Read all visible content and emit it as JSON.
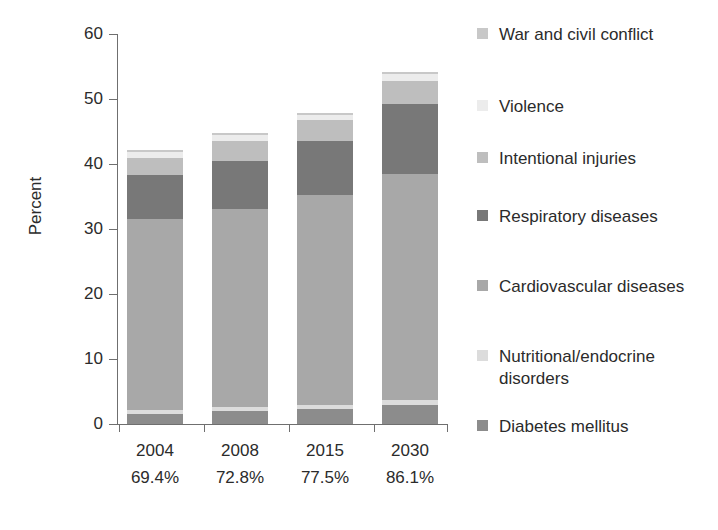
{
  "chart_data": {
    "type": "bar",
    "stacked": true,
    "title": "",
    "subtitle": "",
    "xlabel": "",
    "ylabel": "Percent",
    "ylim": [
      0,
      60
    ],
    "yticks": [
      0,
      10,
      20,
      30,
      40,
      50,
      60
    ],
    "ytick_labels": [
      "0",
      "10",
      "20",
      "30",
      "40",
      "50",
      "60"
    ],
    "grid": false,
    "legend_position": "right",
    "categories": [
      "2004",
      "2008",
      "2015",
      "2030"
    ],
    "category_sublabels": [
      "69.4%",
      "72.8%",
      "77.5%",
      "86.1%"
    ],
    "series": [
      {
        "name": "Diabetes mellitus",
        "color": "#8c8c8c",
        "values": [
          1.6,
          2.0,
          2.3,
          3.0
        ]
      },
      {
        "name": "Nutritional/endocrine disorders",
        "color": "#dcdcdc",
        "values": [
          0.6,
          0.6,
          0.7,
          0.7
        ]
      },
      {
        "name": "Cardiovascular diseases",
        "color": "#a8a8a8",
        "values": [
          29.3,
          30.5,
          32.2,
          34.7
        ]
      },
      {
        "name": "Respiratory diseases",
        "color": "#787878",
        "values": [
          6.8,
          7.4,
          8.4,
          10.9
        ]
      },
      {
        "name": "Intentional injuries",
        "color": "#bebebe",
        "values": [
          2.6,
          3.0,
          3.1,
          3.5
        ]
      },
      {
        "name": "Violence",
        "color": "#ececec",
        "values": [
          1.0,
          0.9,
          0.9,
          1.0
        ]
      },
      {
        "name": "War and civil conflict",
        "color": "#c8c8c8",
        "values": [
          0.3,
          0.3,
          0.3,
          0.3
        ]
      }
    ],
    "totals": [
      42.2,
      44.7,
      47.9,
      54.1
    ]
  },
  "axis": {
    "y_title": "Percent",
    "ticks": [
      {
        "label": "60",
        "value": 60
      },
      {
        "label": "50",
        "value": 50
      },
      {
        "label": "40",
        "value": 40
      },
      {
        "label": "30",
        "value": 30
      },
      {
        "label": "20",
        "value": 20
      },
      {
        "label": "10",
        "value": 10
      },
      {
        "label": "0",
        "value": 0
      }
    ]
  },
  "categories": [
    {
      "year": "2004",
      "percent": "69.4%"
    },
    {
      "year": "2008",
      "percent": "72.8%"
    },
    {
      "year": "2015",
      "percent": "77.5%"
    },
    {
      "year": "2030",
      "percent": "86.1%"
    }
  ],
  "legend": {
    "items": [
      {
        "label": "War and civil conflict",
        "color": "#c8c8c8"
      },
      {
        "label": "Violence",
        "color": "#ececec"
      },
      {
        "label": "Intentional injuries",
        "color": "#bebebe"
      },
      {
        "label": "Respiratory diseases",
        "color": "#787878"
      },
      {
        "label": "Cardiovascular diseases",
        "color": "#a8a8a8"
      },
      {
        "label": "Nutritional/endocrine disorders",
        "color": "#dcdcdc"
      },
      {
        "label": "Diabetes mellitus",
        "color": "#8c8c8c"
      }
    ]
  }
}
